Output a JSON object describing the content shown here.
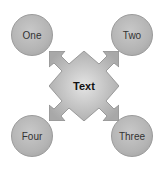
{
  "diagram": {
    "center": {
      "label": "Text"
    },
    "nodes": [
      {
        "label": "One",
        "position": "top-left"
      },
      {
        "label": "Two",
        "position": "top-right"
      },
      {
        "label": "Three",
        "position": "bottom-right"
      },
      {
        "label": "Four",
        "position": "bottom-left"
      }
    ],
    "colors": {
      "circle": "#b4b4b4",
      "center": "#c4c4c4",
      "arrow": "#a0a0a0"
    }
  }
}
